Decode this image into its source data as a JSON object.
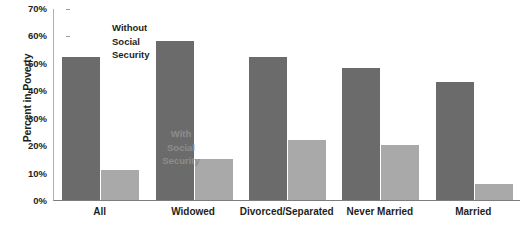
{
  "chart_data": {
    "type": "bar",
    "title": "",
    "xlabel": "",
    "ylabel": "Percent in Poverty",
    "categories": [
      "All",
      "Widowed",
      "Divorced/Separated",
      "Never Married",
      "Married"
    ],
    "series": [
      {
        "name": "Without Social Security",
        "color": "#6b6b6b",
        "values": [
          52,
          58,
          52,
          48,
          43
        ]
      },
      {
        "name": "With Social Security",
        "color": "#a9a9a9",
        "values": [
          11,
          15,
          22,
          20,
          6
        ]
      }
    ],
    "ylim": [
      0,
      70
    ],
    "ytick_values": [
      0,
      10,
      20,
      30,
      40,
      50,
      60,
      70
    ],
    "ytick_labels": [
      "0%",
      "10%",
      "20%",
      "30%",
      "40%",
      "50%",
      "60%",
      "70%"
    ],
    "grid": false,
    "legend_position": "in-plot-annotations",
    "annotations": [
      {
        "id": "without",
        "text": "Without\nSocial\nSecurity",
        "color": "#231f20"
      },
      {
        "id": "with",
        "text": "With\nSocial\nSecurity",
        "color": "#8d8d8d"
      }
    ]
  },
  "axis": {
    "y_title": "Percent in Poverty"
  }
}
